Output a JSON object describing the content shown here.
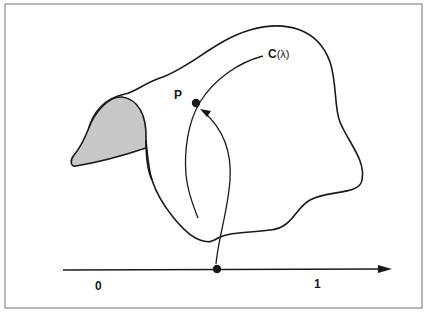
{
  "diagram": {
    "frame": {
      "stroke": "#8a8a8a",
      "background": "#ffffff"
    },
    "region": {
      "name": "blob",
      "stroke": "#1a1a1a",
      "fill": "none"
    },
    "shaded_lobe": {
      "fill": "#c8c8c8",
      "stroke": "#1a1a1a"
    },
    "curve": {
      "label": "C",
      "param": "(λ)"
    },
    "point": {
      "label": "P"
    },
    "axis": {
      "start_label": "0",
      "end_label": "1",
      "stroke": "#1a1a1a"
    }
  }
}
